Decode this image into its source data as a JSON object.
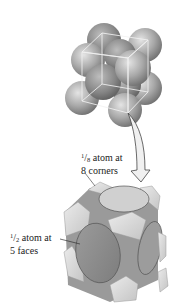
{
  "diagram": {
    "top_view": "Packed spheres (14 atoms) with unit cell cube outline",
    "bottom_view": "Sliced unit cell showing atom fractions",
    "labels": {
      "corners": {
        "numerator": "1",
        "denominator": "8",
        "line1_suffix": " atom at",
        "line2": "8 corners"
      },
      "faces": {
        "numerator": "1",
        "denominator": "2",
        "line1_suffix": " atom at",
        "line2": "5 faces"
      }
    },
    "colors": {
      "sphere": "#a9a9a9",
      "sphere_highlight": "#e4e4e4",
      "sphere_shadow": "#6e6e6e",
      "cube_outline": "#f2f2f2",
      "corner_piece": "#d9d9d9",
      "face_disc": "#8f8f8f",
      "top_face_disc": "#d0d0d0",
      "arrow_fill": "#f0f0f0",
      "arrow_stroke": "#444444"
    }
  }
}
